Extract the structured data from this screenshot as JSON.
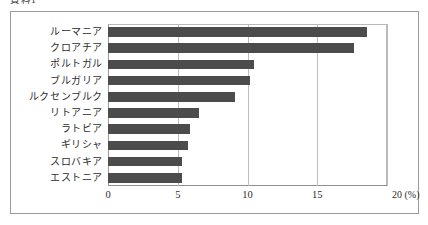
{
  "caption": "資料1",
  "chart_data": {
    "type": "bar",
    "orientation": "horizontal",
    "title": "",
    "subtitle": "",
    "xlabel": "(%)",
    "ylabel": "",
    "unit_label": "20 (%)",
    "categories": [
      "ルーマニア",
      "クロアチア",
      "ポルトガル",
      "ブルガリア",
      "ルクセンブルク",
      "リトアニア",
      "ラトビア",
      "ギリシャ",
      "スロバキア",
      "エストニア"
    ],
    "values": [
      18.6,
      17.6,
      10.5,
      10.2,
      9.1,
      6.5,
      5.9,
      5.7,
      5.3,
      5.3
    ],
    "xlim": [
      0,
      20
    ],
    "xticks": [
      0,
      5,
      10,
      15,
      20
    ],
    "xtick_labels": [
      "0",
      "5",
      "10",
      "15",
      "20"
    ],
    "grid": true,
    "grid_axis": "x",
    "legend": false,
    "bar_color": "#4c4c4c",
    "grid_color": "#bdbdbd",
    "frame_color": "#9b9b9b",
    "background": "#ffffff"
  }
}
